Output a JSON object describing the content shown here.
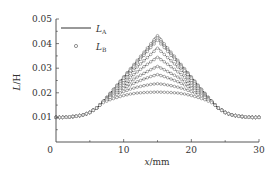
{
  "chart_data": {
    "type": "line",
    "title": "",
    "xlabel": "x/mm",
    "ylabel": "L/H",
    "xlim": [
      0,
      30
    ],
    "ylim": [
      0.0,
      0.05
    ],
    "xticks": [
      0,
      10,
      20,
      30
    ],
    "xtick_labels": [
      "0",
      "10",
      "20",
      "30"
    ],
    "yticks": [
      0.01,
      0.02,
      0.03,
      0.04,
      0.05
    ],
    "ytick_labels": [
      "0.01",
      "0.02",
      "0.03",
      "0.04",
      "0.05"
    ],
    "grid": false,
    "legend": {
      "position": "upper left",
      "entries": [
        {
          "label": "L",
          "subscript": "A",
          "style": "solid-line"
        },
        {
          "label": "L",
          "subscript": "B",
          "style": "open-circle-marker"
        }
      ]
    },
    "x": [
      0,
      1,
      2,
      3,
      4,
      5,
      6,
      7,
      8,
      9,
      10,
      11,
      12,
      13,
      14,
      15,
      16,
      17,
      18,
      19,
      20,
      21,
      22,
      23,
      24,
      25,
      26,
      27,
      28,
      29,
      30
    ],
    "series": [
      {
        "name": "curve-1",
        "peak": 0.0432,
        "values": [
          0.01,
          0.01,
          0.0102,
          0.0105,
          0.011,
          0.012,
          0.0138,
          0.0165,
          0.0198,
          0.0231,
          0.0265,
          0.0298,
          0.0332,
          0.0365,
          0.0399,
          0.0432,
          0.0399,
          0.0365,
          0.0332,
          0.0298,
          0.0265,
          0.0231,
          0.0198,
          0.0165,
          0.0138,
          0.012,
          0.011,
          0.0105,
          0.0102,
          0.01,
          0.01
        ]
      },
      {
        "name": "curve-2",
        "peak": 0.0422,
        "values": [
          0.01,
          0.01,
          0.0102,
          0.0105,
          0.011,
          0.012,
          0.0138,
          0.0165,
          0.0197,
          0.0229,
          0.0262,
          0.0294,
          0.0326,
          0.0358,
          0.039,
          0.0422,
          0.039,
          0.0358,
          0.0326,
          0.0294,
          0.0262,
          0.0229,
          0.0197,
          0.0165,
          0.0138,
          0.012,
          0.011,
          0.0105,
          0.0102,
          0.01,
          0.01
        ]
      },
      {
        "name": "curve-3",
        "peak": 0.0413,
        "values": [
          0.01,
          0.01,
          0.0102,
          0.0105,
          0.011,
          0.012,
          0.0138,
          0.0165,
          0.0196,
          0.0228,
          0.0259,
          0.029,
          0.0321,
          0.0352,
          0.0384,
          0.0413,
          0.0384,
          0.0352,
          0.0321,
          0.029,
          0.0259,
          0.0228,
          0.0196,
          0.0165,
          0.0138,
          0.012,
          0.011,
          0.0105,
          0.0102,
          0.01,
          0.01
        ]
      },
      {
        "name": "curve-4",
        "peak": 0.0381,
        "values": [
          0.01,
          0.01,
          0.0102,
          0.0105,
          0.011,
          0.012,
          0.0138,
          0.0165,
          0.0194,
          0.0222,
          0.025,
          0.0278,
          0.0305,
          0.033,
          0.0356,
          0.0381,
          0.0356,
          0.033,
          0.0305,
          0.0278,
          0.025,
          0.0222,
          0.0194,
          0.0165,
          0.0138,
          0.012,
          0.011,
          0.0105,
          0.0102,
          0.01,
          0.01
        ]
      },
      {
        "name": "curve-5",
        "peak": 0.0344,
        "values": [
          0.01,
          0.01,
          0.0102,
          0.0105,
          0.011,
          0.012,
          0.0138,
          0.0165,
          0.0191,
          0.0216,
          0.024,
          0.0263,
          0.0285,
          0.0306,
          0.0326,
          0.0344,
          0.0326,
          0.0306,
          0.0285,
          0.0263,
          0.024,
          0.0216,
          0.0191,
          0.0165,
          0.0138,
          0.012,
          0.011,
          0.0105,
          0.0102,
          0.01,
          0.01
        ]
      },
      {
        "name": "curve-6",
        "peak": 0.0307,
        "values": [
          0.01,
          0.01,
          0.0102,
          0.0105,
          0.011,
          0.012,
          0.0138,
          0.0165,
          0.0188,
          0.0209,
          0.0229,
          0.0247,
          0.0264,
          0.0279,
          0.0294,
          0.0307,
          0.0294,
          0.0279,
          0.0264,
          0.0247,
          0.0229,
          0.0209,
          0.0188,
          0.0165,
          0.0138,
          0.012,
          0.011,
          0.0105,
          0.0102,
          0.01,
          0.01
        ]
      },
      {
        "name": "curve-7",
        "peak": 0.0274,
        "values": [
          0.01,
          0.01,
          0.0102,
          0.0105,
          0.011,
          0.012,
          0.0138,
          0.0165,
          0.0185,
          0.0202,
          0.0218,
          0.0232,
          0.0245,
          0.0256,
          0.0266,
          0.0274,
          0.0266,
          0.0256,
          0.0245,
          0.0232,
          0.0218,
          0.0202,
          0.0185,
          0.0165,
          0.0138,
          0.012,
          0.011,
          0.0105,
          0.0102,
          0.01,
          0.01
        ]
      },
      {
        "name": "curve-8",
        "peak": 0.0237,
        "values": [
          0.01,
          0.01,
          0.0102,
          0.0105,
          0.011,
          0.012,
          0.0138,
          0.0165,
          0.0181,
          0.0194,
          0.0205,
          0.0215,
          0.0223,
          0.0229,
          0.0234,
          0.0237,
          0.0234,
          0.0229,
          0.0223,
          0.0215,
          0.0205,
          0.0194,
          0.0181,
          0.0165,
          0.0138,
          0.012,
          0.011,
          0.0105,
          0.0102,
          0.01,
          0.01
        ]
      },
      {
        "name": "curve-9",
        "peak": 0.0203,
        "values": [
          0.01,
          0.01,
          0.0102,
          0.0105,
          0.011,
          0.012,
          0.0138,
          0.016,
          0.0172,
          0.0181,
          0.0189,
          0.0195,
          0.0199,
          0.0201,
          0.0202,
          0.0203,
          0.0202,
          0.0201,
          0.0199,
          0.0195,
          0.0189,
          0.0181,
          0.0172,
          0.016,
          0.0138,
          0.012,
          0.011,
          0.0105,
          0.0102,
          0.01,
          0.01
        ]
      }
    ]
  },
  "layout": {
    "plot": {
      "left": 56,
      "right": 259,
      "top": 19,
      "bottom": 142,
      "y_at_top": 0.05,
      "y_at_bottom": 0.0
    },
    "line_color": "#333333",
    "marker_color": "#777777"
  },
  "labels": {
    "xlabel_italic": "x",
    "xlabel_unit": "/mm",
    "ylabel_italic": "L",
    "ylabel_rest": "/H",
    "legend_a_main": "L",
    "legend_a_sub": "A",
    "legend_b_main": "L",
    "legend_b_sub": "B"
  }
}
